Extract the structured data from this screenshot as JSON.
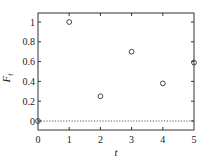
{
  "chart_data": {
    "type": "scatter",
    "title": "",
    "xlabel": "t",
    "ylabel": "F_t",
    "ylabel_main": "F",
    "ylabel_sub": "t",
    "xlim": [
      0,
      5
    ],
    "ylim": [
      -0.1,
      1.1
    ],
    "x_ticks": [
      "0",
      "1",
      "2",
      "3",
      "4",
      "5"
    ],
    "y_ticks": [
      "0",
      "0.2",
      "0.4",
      "0.6",
      "0.8",
      "1"
    ],
    "grid": false,
    "legend": null,
    "series": [
      {
        "name": "F_t",
        "marker": "open-circle",
        "x": [
          0,
          1,
          2,
          3,
          4,
          5
        ],
        "values": [
          0.0,
          1.0,
          0.25,
          0.7,
          0.38,
          0.59
        ]
      }
    ],
    "reference_line": {
      "y": 0,
      "style": "dotted"
    }
  }
}
